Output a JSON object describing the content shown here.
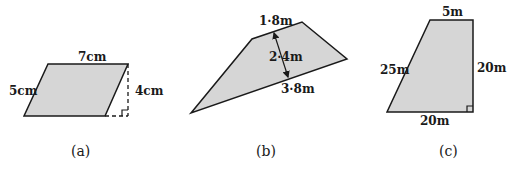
{
  "colors": {
    "fill": "#d6d6d6",
    "stroke": "#1a1a1a",
    "background": "#ffffff"
  },
  "figures": [
    {
      "caption": "(a)",
      "shape": "parallelogram",
      "labels": {
        "top": "7cm",
        "side": "5cm",
        "height": "4cm"
      },
      "right_angle_marker": true,
      "dashed_height": true
    },
    {
      "caption": "(b)",
      "shape": "trapezium",
      "labels": {
        "top": "1·8m",
        "height": "2·4m",
        "bottom": "3·8m"
      },
      "height_arrow": true
    },
    {
      "caption": "(c)",
      "shape": "right trapezium",
      "labels": {
        "top": "5m",
        "slant": "25m",
        "right": "20m",
        "bottom": "20m"
      },
      "right_angle_marker": true
    }
  ]
}
